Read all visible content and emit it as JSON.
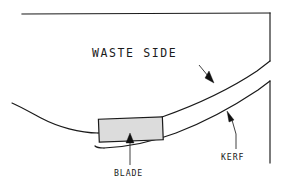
{
  "diagram": {
    "type": "technical-line-drawing",
    "background_color": "#ffffff",
    "line_color": "#1a1a1a",
    "blade_fill_color": "#dcdcdc",
    "labels": {
      "waste_side": "WASTE SIDE",
      "kerf": "KERF",
      "blade": "BLADE"
    },
    "annotations": [
      {
        "name": "waste-side-text",
        "text": "WASTE SIDE"
      },
      {
        "name": "kerf-callout",
        "text": "KERF"
      },
      {
        "name": "blade-callout",
        "text": "BLADE"
      }
    ]
  }
}
